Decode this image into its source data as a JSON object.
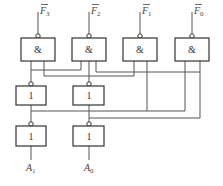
{
  "diagram": {
    "type": "logic-circuit",
    "and_gates": [
      {
        "id": "and3",
        "symbol": "&",
        "input_label": "F",
        "input_sub": "3",
        "x": 21,
        "bar": true
      },
      {
        "id": "and2",
        "symbol": "&",
        "input_label": "F",
        "input_sub": "2",
        "x": 72,
        "bar": true
      },
      {
        "id": "and1",
        "symbol": "&",
        "input_label": "F",
        "input_sub": "1",
        "x": 123,
        "bar": true
      },
      {
        "id": "and0",
        "symbol": "&",
        "input_label": "F",
        "input_sub": "0",
        "x": 175,
        "bar": true
      }
    ],
    "middle_gates": [
      {
        "id": "or1",
        "symbol": "1"
      },
      {
        "id": "or0",
        "symbol": "1"
      }
    ],
    "output_gates": [
      {
        "id": "not1",
        "symbol": "1",
        "output_label": "A",
        "output_sub": "1"
      },
      {
        "id": "not0",
        "symbol": "1",
        "output_label": "A",
        "output_sub": "0"
      }
    ]
  }
}
